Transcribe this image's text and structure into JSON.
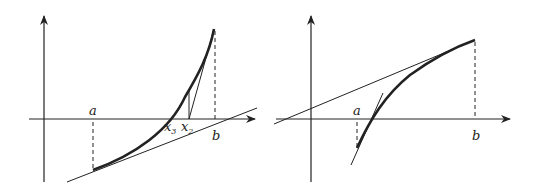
{
  "left_panel": {
    "description": "Newton's method iterations on convex increasing curve",
    "labels": {
      "a": "a",
      "b": "b",
      "x3": "x",
      "x3_sub": "3",
      "x2": "x",
      "x2_sub": "2"
    }
  },
  "right_panel": {
    "description": "Secant and tangent on concave increasing curve",
    "labels": {
      "a": "a",
      "b": "b"
    }
  },
  "colors": {
    "ink": "#222222",
    "background": "#ffffff"
  }
}
